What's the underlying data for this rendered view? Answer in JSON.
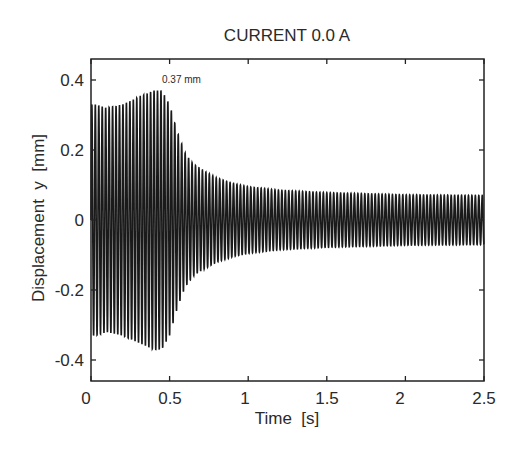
{
  "chart_data": {
    "type": "line",
    "title": "CURRENT  0.0 A",
    "xlabel": "Time  [s]",
    "ylabel": "Displacement  y  [mm]",
    "xlim": [
      0,
      2.5
    ],
    "ylim": [
      -0.46,
      0.46
    ],
    "xticks": [
      0,
      0.5,
      1,
      1.5,
      2,
      2.5
    ],
    "xtick_labels": [
      "0",
      "0.5",
      "1",
      "1.5",
      "2",
      "2.5"
    ],
    "yticks": [
      0.4,
      0.2,
      0,
      -0.2,
      -0.4
    ],
    "ytick_labels": [
      "0.4",
      "0.2",
      "0",
      "-0.2",
      "-0.4"
    ],
    "grid": false,
    "legend": null,
    "annotations": [
      {
        "text": "0.37 mm",
        "x": 0.41,
        "y": 0.41
      }
    ],
    "series": [
      {
        "name": "displacement envelope (oscillating signal, symmetric about 0)",
        "t": [
          0.0,
          0.03,
          0.1,
          0.2,
          0.3,
          0.35,
          0.4,
          0.45,
          0.5,
          0.55,
          0.6,
          0.65,
          0.7,
          0.8,
          0.9,
          1.0,
          1.2,
          1.5,
          2.0,
          2.5
        ],
        "amplitude": [
          0.33,
          0.33,
          0.32,
          0.33,
          0.35,
          0.36,
          0.37,
          0.37,
          0.33,
          0.25,
          0.19,
          0.16,
          0.145,
          0.12,
          0.105,
          0.095,
          0.085,
          0.078,
          0.072,
          0.07
        ]
      }
    ]
  }
}
